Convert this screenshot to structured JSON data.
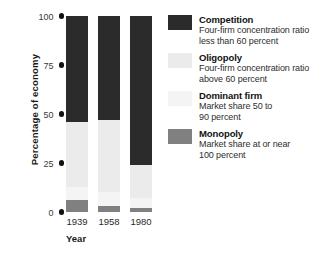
{
  "chart_data": {
    "type": "bar",
    "subtype": "stacked-bar-percentage",
    "title": "",
    "xlabel": "Year",
    "ylabel": "Percentage of economy",
    "categories": [
      "1939",
      "1958",
      "1980"
    ],
    "ylim": [
      0,
      100
    ],
    "yticks": [
      0,
      25,
      50,
      75,
      100
    ],
    "ytick_labels": [
      "0",
      "25",
      "50",
      "75",
      "100"
    ],
    "grid": false,
    "legend_position": "right",
    "stack_order_bottom_to_top": [
      "Monopoly",
      "Dominant firm",
      "Oligopoly",
      "Competition"
    ],
    "series": [
      {
        "name": "Competition",
        "color": "#2b2b2b",
        "values": [
          54,
          53,
          76
        ]
      },
      {
        "name": "Oligopoly",
        "color": "#ebebeb",
        "values": [
          33,
          37,
          17
        ]
      },
      {
        "name": "Dominant firm",
        "color": "#f4f4f4",
        "values": [
          7,
          7,
          5
        ]
      },
      {
        "name": "Monopoly",
        "color": "#808080",
        "values": [
          6,
          3,
          2
        ]
      }
    ]
  },
  "axes": {
    "y_title": "Percentage of economy",
    "x_title": "Year",
    "y_ticks": [
      {
        "value": 100,
        "label": "100"
      },
      {
        "value": 75,
        "label": "75"
      },
      {
        "value": 50,
        "label": "50"
      },
      {
        "value": 25,
        "label": "25"
      },
      {
        "value": 0,
        "label": "0"
      }
    ],
    "x_ticks": [
      {
        "label": "1939"
      },
      {
        "label": "1958"
      },
      {
        "label": "1980"
      }
    ]
  },
  "legend": {
    "items": [
      {
        "label": "Competition",
        "description_line1": "Four-firm concentration ratio",
        "description_line2": "less than 60 percent",
        "color": "#2b2b2b"
      },
      {
        "label": "Oligopoly",
        "description_line1": "Four-firm concentration ratio",
        "description_line2": "above 60 percent",
        "color": "#ebebeb"
      },
      {
        "label": "Dominant firm",
        "description_line1": "Market share 50 to",
        "description_line2": "90 percent",
        "color": "#f4f4f4"
      },
      {
        "label": "Monopoly",
        "description_line1": "Market share at or near",
        "description_line2": "100 percent",
        "color": "#808080"
      }
    ]
  }
}
